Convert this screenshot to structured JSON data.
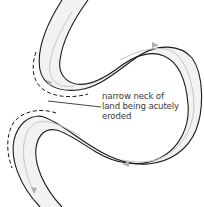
{
  "diagram": {
    "annotation": {
      "lines": [
        "narrow neck of",
        "land being acutely",
        "eroded"
      ]
    },
    "legend_semantics": {
      "solid_dark_line": "current river bank",
      "dashed_line": "former / eroding bank position",
      "grey_arrows": "direction of river flow"
    },
    "colors": {
      "bank": "#1a1a1a",
      "dashed_bank": "#1a1a1a",
      "channel_fill": "#f2f2f2",
      "flow_arrow": "#b8b8b8",
      "text": "#3a3a3a",
      "background": "#ffffff"
    }
  }
}
